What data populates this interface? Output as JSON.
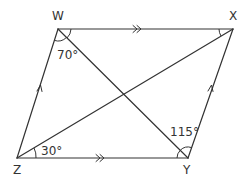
{
  "diagram": {
    "type": "parallelogram",
    "vertices": {
      "W": {
        "label": "W",
        "x": 58,
        "y": 29
      },
      "X": {
        "label": "X",
        "x": 233,
        "y": 29
      },
      "Y": {
        "label": "Y",
        "x": 188,
        "y": 158
      },
      "Z": {
        "label": "Z",
        "x": 17,
        "y": 158
      }
    },
    "sides": [
      {
        "from": "W",
        "to": "X",
        "marker": "double-arrow"
      },
      {
        "from": "Z",
        "to": "Y",
        "marker": "double-arrow"
      },
      {
        "from": "Z",
        "to": "W",
        "marker": "single-arrow"
      },
      {
        "from": "Y",
        "to": "X",
        "marker": "single-arrow"
      }
    ],
    "diagonals": [
      {
        "from": "W",
        "to": "Y"
      },
      {
        "from": "Z",
        "to": "X"
      }
    ],
    "angles": [
      {
        "vertex": "W",
        "label": "70°"
      },
      {
        "vertex": "Z",
        "label": "30°"
      },
      {
        "vertex": "Y",
        "label": "115°"
      },
      {
        "vertex": "X",
        "label": ""
      }
    ],
    "color": "#333333"
  }
}
